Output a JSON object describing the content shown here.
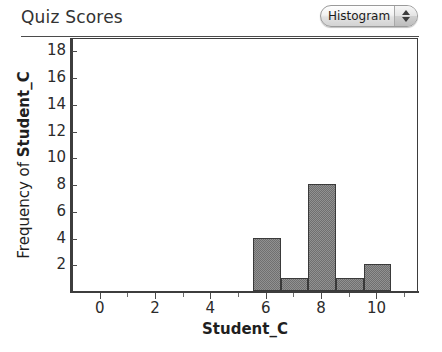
{
  "header": {
    "title": "Quiz Scores"
  },
  "plot_type_selector": {
    "value": "Histogram",
    "up_icon": "triangle-up-icon",
    "down_icon": "triangle-down-icon"
  },
  "chart_data": {
    "type": "bar",
    "title": "Quiz Scores",
    "xlabel": "Student_C",
    "ylabel_prefix": "Frequency of ",
    "ylabel_variable": "Student_C",
    "ylabel": "Frequency of Student_C",
    "grid": false,
    "legend": null,
    "xlim": [
      -1,
      11.5
    ],
    "ylim": [
      0,
      19
    ],
    "xticks": [
      0,
      2,
      4,
      6,
      8,
      10
    ],
    "xtick_labels": [
      "0",
      "2",
      "4",
      "6",
      "8",
      "10"
    ],
    "xticks_minor": [
      1,
      3,
      5,
      7,
      9,
      11
    ],
    "yticks": [
      2,
      4,
      6,
      8,
      10,
      12,
      14,
      16,
      18
    ],
    "ytick_labels": [
      "2",
      "4",
      "6",
      "8",
      "10",
      "12",
      "14",
      "16",
      "18"
    ],
    "bin_width": 1,
    "bins": [
      {
        "left": 5.5,
        "right": 6.5,
        "center": 6,
        "value": 4
      },
      {
        "left": 6.5,
        "right": 7.5,
        "center": 7,
        "value": 1
      },
      {
        "left": 7.5,
        "right": 8.5,
        "center": 8,
        "value": 8
      },
      {
        "left": 8.5,
        "right": 9.5,
        "center": 9,
        "value": 1
      },
      {
        "left": 9.5,
        "right": 10.5,
        "center": 10,
        "value": 2
      }
    ],
    "categories": [
      "6",
      "7",
      "8",
      "9",
      "10"
    ],
    "values": [
      4,
      1,
      8,
      1,
      2
    ],
    "bar_fill_color": "#8a8a8a",
    "bar_edge_color": "#3a3a3a"
  }
}
